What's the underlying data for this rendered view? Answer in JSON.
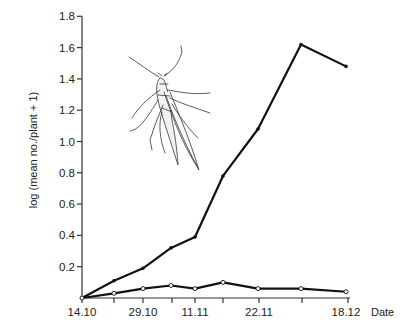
{
  "chart_data": {
    "type": "line",
    "title": "",
    "xlabel": "Date",
    "ylabel": "log (mean no./plant + 1)",
    "ylim": [
      0,
      1.8
    ],
    "yticks": [
      0.2,
      0.4,
      0.6,
      0.8,
      1.0,
      1.2,
      1.4,
      1.6,
      1.8
    ],
    "ytick_labels": [
      "0.2",
      "0.4",
      "0.6",
      "0.8",
      "1.0",
      "1.2",
      "1.4",
      "1.6",
      "1.8"
    ],
    "xtick_labels": [
      "14.10",
      "29.10",
      "11.11",
      "22.11",
      "18.12"
    ],
    "grid": false,
    "legend": null,
    "annotations": [
      "aphid illustration (upper left of plot)"
    ],
    "x_positions_px": [
      82,
      114,
      143,
      171,
      195,
      223,
      258,
      301,
      346
    ],
    "x_tick_px": [
      82,
      114,
      143,
      172,
      195,
      223,
      259,
      302,
      348
    ],
    "x_labeled_ticks": {
      "14.10": 82,
      "29.10": 143,
      "11.11": 195,
      "22.11": 259,
      "18.12": 346
    },
    "series": [
      {
        "name": "Series A (filled markers)",
        "marker": "filled",
        "values": [
          0.0,
          0.11,
          0.19,
          0.32,
          0.39,
          0.78,
          1.08,
          1.62,
          1.48
        ]
      },
      {
        "name": "Series B (open markers)",
        "marker": "open",
        "values": [
          0.0,
          0.03,
          0.06,
          0.08,
          0.06,
          0.1,
          0.06,
          0.06,
          0.04
        ]
      }
    ]
  },
  "labels": {
    "ylabel": "log (mean no./plant + 1)",
    "xlabel": "Date"
  },
  "colors": {
    "line": "#111111",
    "axis": "#333333",
    "background": "#ffffff"
  }
}
